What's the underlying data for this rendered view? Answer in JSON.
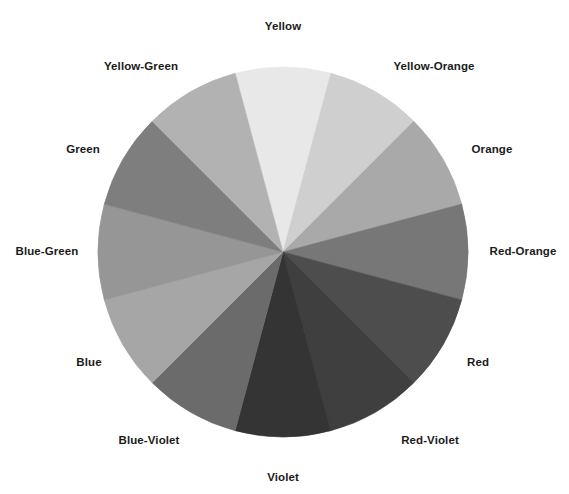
{
  "figure": {
    "type": "color-wheel",
    "title": "",
    "background_color": "#ffffff",
    "label_color": "#1b1b1b",
    "center_x": 283,
    "center_y": 252,
    "radius": 185,
    "segment_count": 12,
    "segment_arc_degrees": 30
  },
  "chart_data": {
    "type": "pie",
    "title": "",
    "subtitle": "",
    "xlabel": "",
    "ylabel": "",
    "legend_position": "around-perimeter",
    "grid": false,
    "categories": [
      "Yellow",
      "Yellow-Orange",
      "Orange",
      "Red-Orange",
      "Red",
      "Red-Violet",
      "Violet",
      "Blue-Violet",
      "Blue",
      "Blue-Green",
      "Green",
      "Yellow-Green"
    ],
    "values": [
      8.333,
      8.333,
      8.333,
      8.333,
      8.333,
      8.333,
      8.333,
      8.333,
      8.333,
      8.333,
      8.333,
      8.333
    ],
    "colors": [
      "#e8e8e8",
      "#cfcfcf",
      "#a9a9a9",
      "#777777",
      "#4d4d4d",
      "#3f3f3f",
      "#343434",
      "#6b6b6b",
      "#a6a6a6",
      "#969696",
      "#7e7e7e",
      "#b2b2b2"
    ],
    "start_angle_deg": -105,
    "direction": "clockwise"
  },
  "segments": [
    {
      "label": "Yellow",
      "color": "#e8e8e8",
      "start_deg": -105,
      "end_deg": -75,
      "label_x": 283,
      "label_y": 26
    },
    {
      "label": "Yellow-Orange",
      "color": "#cfcfcf",
      "start_deg": -75,
      "end_deg": -45,
      "label_x": 434,
      "label_y": 66
    },
    {
      "label": "Orange",
      "color": "#a9a9a9",
      "start_deg": -45,
      "end_deg": -15,
      "label_x": 492,
      "label_y": 149
    },
    {
      "label": "Red-Orange",
      "color": "#777777",
      "start_deg": -15,
      "end_deg": 15,
      "label_x": 523,
      "label_y": 251
    },
    {
      "label": "Red",
      "color": "#4d4d4d",
      "start_deg": 15,
      "end_deg": 45,
      "label_x": 478,
      "label_y": 362
    },
    {
      "label": "Red-Violet",
      "color": "#3f3f3f",
      "start_deg": 45,
      "end_deg": 75,
      "label_x": 430,
      "label_y": 440
    },
    {
      "label": "Violet",
      "color": "#343434",
      "start_deg": 75,
      "end_deg": 105,
      "label_x": 283,
      "label_y": 477
    },
    {
      "label": "Blue-Violet",
      "color": "#6b6b6b",
      "start_deg": 105,
      "end_deg": 135,
      "label_x": 149,
      "label_y": 440
    },
    {
      "label": "Blue",
      "color": "#a6a6a6",
      "start_deg": 135,
      "end_deg": 165,
      "label_x": 89,
      "label_y": 362
    },
    {
      "label": "Blue-Green",
      "color": "#969696",
      "start_deg": 165,
      "end_deg": 195,
      "label_x": 47,
      "label_y": 251
    },
    {
      "label": "Green",
      "color": "#7e7e7e",
      "start_deg": 195,
      "end_deg": 225,
      "label_x": 83,
      "label_y": 149
    },
    {
      "label": "Yellow-Green",
      "color": "#b2b2b2",
      "start_deg": 225,
      "end_deg": 255,
      "label_x": 141,
      "label_y": 66
    }
  ]
}
